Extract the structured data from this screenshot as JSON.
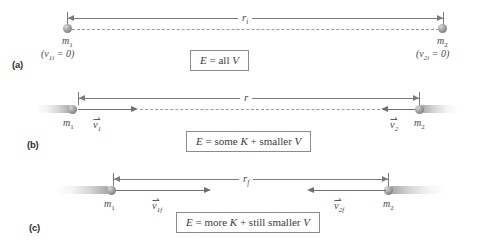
{
  "figure": {
    "panels": [
      {
        "letter": "(a)",
        "distance_label": "r",
        "distance_subscript": "i",
        "left_mass": "m",
        "left_mass_subscript": "1",
        "right_mass": "m",
        "right_mass_subscript": "2",
        "left_velocity_note": "(v",
        "left_velocity_note_sub": "1i",
        "left_velocity_note_tail": " = 0)",
        "right_velocity_note": "(v",
        "right_velocity_note_sub": "2i",
        "right_velocity_note_tail": " = 0)",
        "energy_text_parts": {
          "e": "E",
          "eq": " = all ",
          "v": "V"
        },
        "state": "at rest, separated by r sub i"
      },
      {
        "letter": "(b)",
        "distance_label": "r",
        "distance_subscript": "",
        "left_mass": "m",
        "left_mass_subscript": "1",
        "right_mass": "m",
        "right_mass_subscript": "2",
        "left_vel": "v",
        "left_vel_subscript": "1",
        "right_vel": "v",
        "right_vel_subscript": "2",
        "energy_text_parts": {
          "e": "E",
          "eq": " = some ",
          "k": "K",
          "plus": " + smaller ",
          "v": "V"
        },
        "state": "moving toward each other"
      },
      {
        "letter": "(c)",
        "distance_label": "r",
        "distance_subscript": "f",
        "left_mass": "m",
        "left_mass_subscript": "1",
        "right_mass": "m",
        "right_mass_subscript": "2",
        "left_vel": "v",
        "left_vel_subscript": "1f",
        "right_vel": "v",
        "right_vel_subscript": "2f",
        "energy_text_parts": {
          "e": "E",
          "eq": " = more ",
          "k": "K",
          "plus": " + still smaller ",
          "v": "V"
        },
        "state": "closer together, moving faster"
      }
    ],
    "colors": {
      "line": "#7a7a7a",
      "vector": "#6f6f6f",
      "dashed": "#9a9a9a",
      "text": "#3b3b3b",
      "box_border": "#8c8c8c",
      "sphere": "#8a8a8a"
    },
    "vector_arrow_glyph": "⇀"
  }
}
